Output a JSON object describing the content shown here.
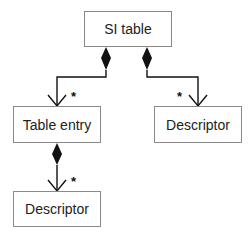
{
  "diagram": {
    "type": "uml-class-composition",
    "nodes": [
      {
        "id": "si_table",
        "label": "SI table"
      },
      {
        "id": "table_entry",
        "label": "Table entry"
      },
      {
        "id": "descriptor_right",
        "label": "Descriptor"
      },
      {
        "id": "descriptor_bottom",
        "label": "Descriptor"
      }
    ],
    "edges": [
      {
        "from": "si_table",
        "to": "table_entry",
        "kind": "composition",
        "multiplicity": "*"
      },
      {
        "from": "si_table",
        "to": "descriptor_right",
        "kind": "composition",
        "multiplicity": "*"
      },
      {
        "from": "table_entry",
        "to": "descriptor_bottom",
        "kind": "composition",
        "multiplicity": "*"
      }
    ],
    "colors": {
      "line": "#111111",
      "box_border": "#8a8a8a",
      "background": "#ffffff"
    }
  }
}
